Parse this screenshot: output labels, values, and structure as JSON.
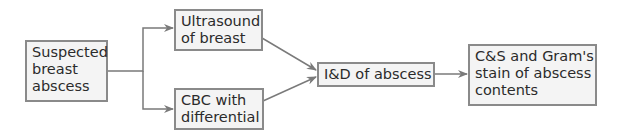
{
  "diagram": {
    "type": "flowchart",
    "colors": {
      "box_fill": "#f4f4f4",
      "box_border": "#8a8a8a",
      "arrow": "#7a7a7a",
      "text": "#2b2b2b"
    },
    "nodes": [
      {
        "id": "suspected",
        "label": "Suspected\nbreast\nabscess"
      },
      {
        "id": "ultrasound",
        "label": "Ultrasound\nof breast"
      },
      {
        "id": "cbc",
        "label": "CBC with\ndifferential"
      },
      {
        "id": "id",
        "label": "I&D of abscess"
      },
      {
        "id": "cs",
        "label": "C&S and Gram's\nstain of abscess\ncontents"
      }
    ],
    "edges": [
      {
        "from": "suspected",
        "to": "ultrasound"
      },
      {
        "from": "suspected",
        "to": "cbc"
      },
      {
        "from": "ultrasound",
        "to": "id"
      },
      {
        "from": "cbc",
        "to": "id"
      },
      {
        "from": "id",
        "to": "cs"
      }
    ]
  }
}
